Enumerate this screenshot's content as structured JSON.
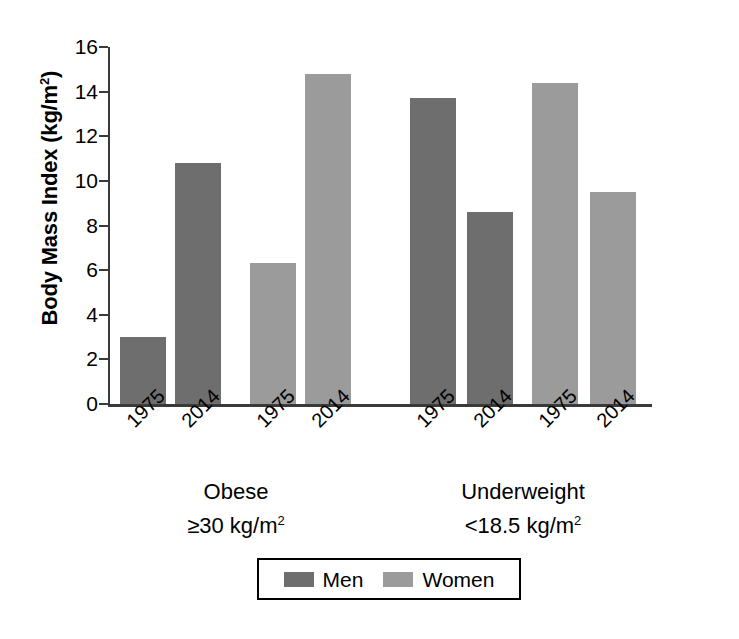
{
  "chart_data": {
    "type": "bar",
    "title": "",
    "xlabel": "",
    "ylabel": "Body Mass Index (kg/m2)",
    "ylabel_base": "Body Mass Index (kg/m",
    "ylabel_sup": "2",
    "ylabel_tail": ")",
    "ylim": [
      0,
      16
    ],
    "ytick_values": [
      0,
      2,
      4,
      6,
      8,
      10,
      12,
      14,
      16
    ],
    "ytick_labels": [
      "0",
      "2",
      "4",
      "6",
      "8",
      "10",
      "12",
      "14",
      "16"
    ],
    "grid": false,
    "legend_position": "bottom-center",
    "categories": [
      "1975",
      "2014",
      "1975",
      "2014",
      "1975",
      "2014",
      "1975",
      "2014"
    ],
    "groups": [
      {
        "name": "Obese",
        "criterion_prefix": "≥30 kg/m",
        "criterion_sup": "2",
        "criterion_full": "≥30 kg/m2"
      },
      {
        "name": "Underweight",
        "criterion_prefix": "<18.5 kg/m",
        "criterion_sup": "2",
        "criterion_full": "<18.5 kg/m2"
      }
    ],
    "series": [
      {
        "name": "Men",
        "color": "#6e6e6e"
      },
      {
        "name": "Women",
        "color": "#9b9b9b"
      }
    ],
    "bars": [
      {
        "group": "Obese",
        "series": "Men",
        "year": "1975",
        "value": 3.0
      },
      {
        "group": "Obese",
        "series": "Men",
        "year": "2014",
        "value": 10.8
      },
      {
        "group": "Obese",
        "series": "Women",
        "year": "1975",
        "value": 6.3
      },
      {
        "group": "Obese",
        "series": "Women",
        "year": "2014",
        "value": 14.8
      },
      {
        "group": "Underweight",
        "series": "Men",
        "year": "1975",
        "value": 13.7
      },
      {
        "group": "Underweight",
        "series": "Men",
        "year": "2014",
        "value": 8.6
      },
      {
        "group": "Underweight",
        "series": "Women",
        "year": "1975",
        "value": 14.4
      },
      {
        "group": "Underweight",
        "series": "Women",
        "year": "2014",
        "value": 9.5
      }
    ],
    "colors": {
      "men": "#6e6e6e",
      "women": "#9b9b9b",
      "axis": "#3a3a3a",
      "text": "#000000",
      "background": "#ffffff"
    }
  },
  "legend": {
    "entries": [
      {
        "label": "Men",
        "color": "#6e6e6e"
      },
      {
        "label": "Women",
        "color": "#9b9b9b"
      }
    ]
  }
}
